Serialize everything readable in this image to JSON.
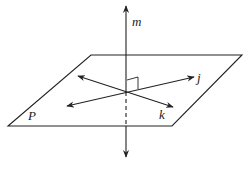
{
  "diagram": {
    "labels": {
      "line_m": "m",
      "line_j": "j",
      "line_k": "k",
      "plane": "P"
    },
    "colors": {
      "stroke": "#222222",
      "background": "#ffffff"
    }
  }
}
